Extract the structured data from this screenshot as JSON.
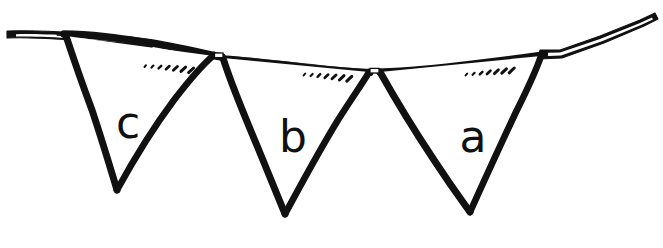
{
  "figure": {
    "type": "line-drawing",
    "background_color": "#ffffff",
    "ink_color": "#111111",
    "canvas": {
      "width": 663,
      "height": 248
    }
  },
  "string": {
    "name": "bunting-string",
    "color": "#111111",
    "left_tip": {
      "x": 6,
      "y": 34
    },
    "right_tip": {
      "x": 657,
      "y": 14
    },
    "sag_low_point": {
      "x": 375,
      "y": 72
    },
    "path": "M6,34 L60,33 L155,44 L222,58 L300,66 L375,72 L452,68 L520,60 L560,52 L657,14"
  },
  "flags": [
    {
      "id": "flag-c",
      "label": "c",
      "order": 1,
      "top_left": {
        "x": 66,
        "y": 37
      },
      "top_right": {
        "x": 214,
        "y": 56
      },
      "apex": {
        "x": 117,
        "y": 190
      },
      "label_pos": {
        "x": 128,
        "y": 122
      },
      "hatch": {
        "count": 7,
        "start": {
          "x": 144,
          "y": 66
        },
        "end": {
          "x": 190,
          "y": 71
        }
      }
    },
    {
      "id": "flag-b",
      "label": "b",
      "order": 2,
      "top_left": {
        "x": 223,
        "y": 59
      },
      "top_right": {
        "x": 369,
        "y": 72
      },
      "apex": {
        "x": 285,
        "y": 214
      },
      "label_pos": {
        "x": 293,
        "y": 137
      },
      "hatch": {
        "count": 7,
        "start": {
          "x": 304,
          "y": 74
        },
        "end": {
          "x": 348,
          "y": 79
        }
      }
    },
    {
      "id": "flag-a",
      "label": "a",
      "order": 3,
      "top_left": {
        "x": 380,
        "y": 72
      },
      "top_right": {
        "x": 541,
        "y": 56
      },
      "apex": {
        "x": 470,
        "y": 212
      },
      "label_pos": {
        "x": 473,
        "y": 136
      },
      "hatch": {
        "count": 7,
        "start": {
          "x": 466,
          "y": 74
        },
        "end": {
          "x": 512,
          "y": 69
        }
      }
    }
  ],
  "joints": [
    {
      "id": "joint-left",
      "x": 218,
      "y": 57
    },
    {
      "id": "joint-right",
      "x": 374,
      "y": 72
    }
  ]
}
